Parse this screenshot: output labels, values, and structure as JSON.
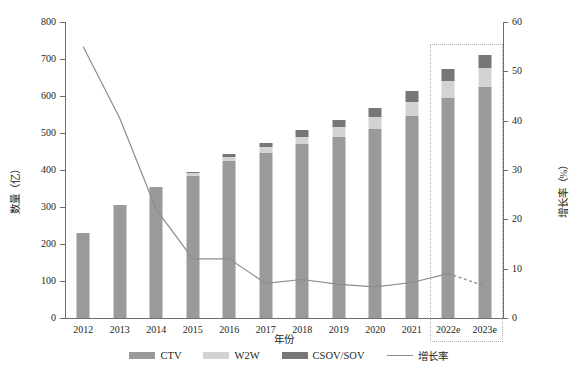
{
  "chart_data": {
    "type": "bar",
    "title": "",
    "subtitle": "",
    "xlabel": "年份",
    "ylabel": "数量（亿）",
    "y2label": "增长率（%）",
    "categories": [
      "2012",
      "2013",
      "2014",
      "2015",
      "2016",
      "2017",
      "2018",
      "2019",
      "2020",
      "2021",
      "2022e",
      "2023e"
    ],
    "ylim": [
      0,
      800
    ],
    "yticks": [
      "0",
      "100",
      "200",
      "300",
      "400",
      "500",
      "600",
      "700",
      "800"
    ],
    "y2lim": [
      0,
      60
    ],
    "y2ticks": [
      "0",
      "10",
      "20",
      "30",
      "40",
      "50",
      "60"
    ],
    "grid": false,
    "legend_position": "bottom",
    "series": [
      {
        "name": "CTV",
        "type": "bar-stack",
        "color": "#9a9a9a",
        "values": [
          230,
          305,
          355,
          385,
          425,
          447,
          470,
          490,
          510,
          545,
          595,
          625
        ]
      },
      {
        "name": "W2W",
        "type": "bar-stack",
        "color": "#d3d3d3",
        "values": [
          0,
          0,
          0,
          6,
          10,
          14,
          20,
          25,
          32,
          38,
          45,
          52
        ]
      },
      {
        "name": "CSOV/SOV",
        "type": "bar-stack",
        "color": "#777777",
        "values": [
          0,
          0,
          0,
          5,
          7,
          13,
          18,
          20,
          27,
          30,
          32,
          35
        ]
      },
      {
        "name": "增长率",
        "type": "line",
        "color": "#8c8c8c",
        "axis": "right",
        "values": [
          55.0,
          40.5,
          22.0,
          12.0,
          12.0,
          7.0,
          7.8,
          6.8,
          6.3,
          7.2,
          9.0,
          6.5
        ],
        "dashed_from": "2022e"
      }
    ],
    "annotations": [
      {
        "type": "forecast-box",
        "label": "",
        "covers": [
          "2022e",
          "2023e"
        ],
        "style": "dotted"
      }
    ]
  },
  "legend": {
    "items": [
      {
        "label": "CTV",
        "marker": "bar-swatch",
        "color": "#9a9a9a"
      },
      {
        "label": "W2W",
        "marker": "bar-swatch",
        "color": "#d3d3d3"
      },
      {
        "label": "CSOV/SOV",
        "marker": "bar-swatch",
        "color": "#777777"
      },
      {
        "label": "增长率",
        "marker": "line-swatch",
        "color": "#8c8c8c"
      }
    ]
  }
}
